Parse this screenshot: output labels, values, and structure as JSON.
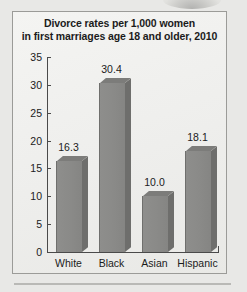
{
  "chart_data": {
    "type": "bar",
    "title": "Divorce rates per 1,000 women in first marriages age 18 and older, 2010",
    "title_lines": [
      "Divorce rates per 1,000 women",
      "in first marriages age 18 and older, 2010"
    ],
    "categories": [
      "White",
      "Black",
      "Asian",
      "Hispanic"
    ],
    "values": [
      16.3,
      30.4,
      10.0,
      18.1
    ],
    "value_labels": [
      "16.3",
      "30.4",
      "10.0",
      "18.1"
    ],
    "xlabel": "",
    "ylabel": "",
    "ylim": [
      0,
      35
    ],
    "yticks": [
      0,
      5,
      10,
      15,
      20,
      25,
      30,
      35
    ],
    "ytick_labels": [
      "0",
      "5",
      "10",
      "15",
      "20",
      "25",
      "30",
      "35"
    ],
    "grid": false,
    "legend": false,
    "bar_color": "#8a8a88",
    "bar_side_color": "#6e6e6c",
    "bar_top_color": "#7c7c7a",
    "axis_color": "#4a4a4a",
    "plot_background": "#f2f2f0",
    "page_background": "#e8e8e6",
    "text_color": "#1b1b1b"
  }
}
